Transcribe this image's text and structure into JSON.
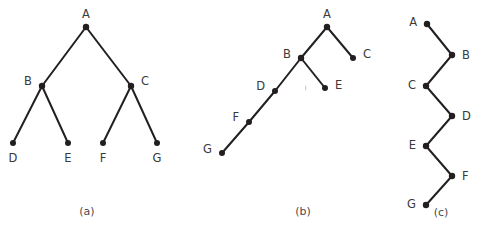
{
  "figure": {
    "width": 478,
    "height": 238,
    "background_color": "#ffffff",
    "line_color": "#231f20",
    "node_color": "#231f20",
    "label_color": "#3a3a3a",
    "caption_color": "#4a4a4a"
  },
  "panels": [
    {
      "id": "a",
      "caption": "(a)",
      "caption_x": 87,
      "caption_y": 212,
      "description": "balanced binary tree",
      "nodes": [
        {
          "id": "A",
          "label": "A",
          "x": 86,
          "y": 27,
          "r": 3.2,
          "label_x": 86,
          "label_y": 14,
          "anchor": "middle"
        },
        {
          "id": "B",
          "label": "B",
          "x": 42,
          "y": 86,
          "r": 3.2,
          "label_x": 32,
          "label_y": 81,
          "anchor": "end"
        },
        {
          "id": "C",
          "label": "C",
          "x": 131,
          "y": 86,
          "r": 3.2,
          "label_x": 141,
          "label_y": 81,
          "anchor": "start"
        },
        {
          "id": "D",
          "label": "D",
          "x": 13,
          "y": 143,
          "r": 3.0,
          "label_x": 13,
          "label_y": 158,
          "anchor": "middle"
        },
        {
          "id": "E",
          "label": "E",
          "x": 68,
          "y": 143,
          "r": 3.0,
          "label_x": 68,
          "label_y": 158,
          "anchor": "middle"
        },
        {
          "id": "F",
          "label": "F",
          "x": 103,
          "y": 143,
          "r": 3.0,
          "label_x": 103,
          "label_y": 158,
          "anchor": "middle"
        },
        {
          "id": "G",
          "label": "G",
          "x": 157,
          "y": 143,
          "r": 3.0,
          "label_x": 157,
          "label_y": 158,
          "anchor": "middle"
        }
      ],
      "edges": [
        {
          "from": "A",
          "to": "B"
        },
        {
          "from": "A",
          "to": "C"
        },
        {
          "from": "B",
          "to": "D"
        },
        {
          "from": "B",
          "to": "E"
        },
        {
          "from": "C",
          "to": "F"
        },
        {
          "from": "C",
          "to": "G"
        }
      ]
    },
    {
      "id": "b",
      "caption": "(b)",
      "caption_x": 303,
      "caption_y": 212,
      "description": "left-leaning skewed tree",
      "nodes": [
        {
          "id": "A",
          "label": "A",
          "x": 327,
          "y": 27,
          "r": 3.2,
          "label_x": 327,
          "label_y": 14,
          "anchor": "middle"
        },
        {
          "id": "B",
          "label": "B",
          "x": 301,
          "y": 58,
          "r": 3.2,
          "label_x": 291,
          "label_y": 54,
          "anchor": "end"
        },
        {
          "id": "C",
          "label": "C",
          "x": 353,
          "y": 58,
          "r": 3.0,
          "label_x": 363,
          "label_y": 54,
          "anchor": "start"
        },
        {
          "id": "D",
          "label": "D",
          "x": 275,
          "y": 91,
          "r": 3.0,
          "label_x": 265,
          "label_y": 86,
          "anchor": "end"
        },
        {
          "id": "E",
          "label": "E",
          "x": 325,
          "y": 88,
          "r": 3.0,
          "label_x": 335,
          "label_y": 85,
          "anchor": "start"
        },
        {
          "id": "F",
          "label": "F",
          "x": 249,
          "y": 122,
          "r": 3.0,
          "label_x": 239,
          "label_y": 117,
          "anchor": "end"
        },
        {
          "id": "G",
          "label": "G",
          "x": 222,
          "y": 153,
          "r": 3.0,
          "label_x": 212,
          "label_y": 149,
          "anchor": "end"
        }
      ],
      "edges": [
        {
          "from": "A",
          "to": "B"
        },
        {
          "from": "A",
          "to": "C"
        },
        {
          "from": "B",
          "to": "D"
        },
        {
          "from": "B",
          "to": "E"
        },
        {
          "from": "D",
          "to": "F"
        },
        {
          "from": "F",
          "to": "G"
        }
      ]
    },
    {
      "id": "c",
      "caption": "(c)",
      "caption_x": 441,
      "caption_y": 213,
      "description": "zigzag chain tree",
      "nodes": [
        {
          "id": "A",
          "label": "A",
          "x": 427,
          "y": 24,
          "r": 3.2,
          "label_x": 417,
          "label_y": 22,
          "anchor": "end"
        },
        {
          "id": "B",
          "label": "B",
          "x": 452,
          "y": 55,
          "r": 3.2,
          "label_x": 462,
          "label_y": 55,
          "anchor": "start"
        },
        {
          "id": "C",
          "label": "C",
          "x": 426,
          "y": 86,
          "r": 3.2,
          "label_x": 416,
          "label_y": 85,
          "anchor": "end"
        },
        {
          "id": "D",
          "label": "D",
          "x": 452,
          "y": 116,
          "r": 3.2,
          "label_x": 462,
          "label_y": 116,
          "anchor": "start"
        },
        {
          "id": "E",
          "label": "E",
          "x": 426,
          "y": 146,
          "r": 3.2,
          "label_x": 416,
          "label_y": 145,
          "anchor": "end"
        },
        {
          "id": "F",
          "label": "F",
          "x": 452,
          "y": 176,
          "r": 3.2,
          "label_x": 462,
          "label_y": 176,
          "anchor": "start"
        },
        {
          "id": "G",
          "label": "G",
          "x": 426,
          "y": 205,
          "r": 3.2,
          "label_x": 416,
          "label_y": 204,
          "anchor": "end"
        }
      ],
      "edges": [
        {
          "from": "A",
          "to": "B"
        },
        {
          "from": "B",
          "to": "C"
        },
        {
          "from": "C",
          "to": "D"
        },
        {
          "from": "D",
          "to": "E"
        },
        {
          "from": "E",
          "to": "F"
        },
        {
          "from": "F",
          "to": "G"
        }
      ]
    }
  ],
  "artifacts": [
    {
      "x": 305,
      "y": 88,
      "w": 1.2,
      "h": 5
    }
  ]
}
